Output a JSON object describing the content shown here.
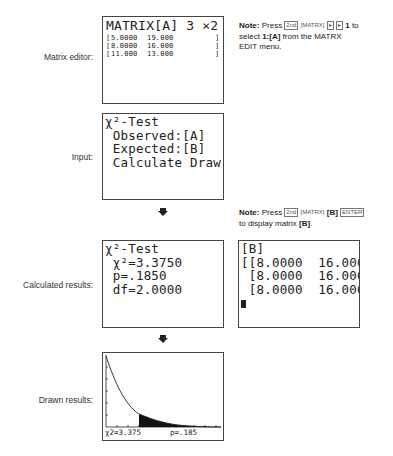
{
  "rows": {
    "matrix_editor": {
      "label": "Matrix editor:"
    },
    "input": {
      "label": "Input:"
    },
    "calculated": {
      "label": "Calculated results:"
    },
    "drawn": {
      "label": "Drawn results:"
    }
  },
  "screens": {
    "matrix_a": {
      "title": "MATRIX[A] 3 ×2",
      "rows": [
        {
          "open": "[",
          "c1": "5.0000",
          "c2": "19.000",
          "close": "]"
        },
        {
          "open": "[",
          "c1": "8.0000",
          "c2": "16.000",
          "close": "]"
        },
        {
          "open": "[",
          "c1": "11.000",
          "c2": "13.000",
          "close": "]"
        }
      ]
    },
    "input": {
      "lines": [
        "χ²-Test",
        " Observed:[A]",
        " Expected:[B]",
        " Calculate Draw"
      ]
    },
    "results": {
      "lines": [
        "χ²-Test",
        " χ²=3.3750",
        " p=.1850",
        " df=2.0000"
      ]
    },
    "matrix_b": {
      "lines": [
        "[B]",
        "[[8.0000  16.000…",
        " [8.0000  16.000…",
        " [8.0000  16.000…"
      ]
    },
    "graph": {
      "chi_label": "χ2=3.375",
      "p_label": "p=.185"
    }
  },
  "notes": {
    "note1": {
      "prefix": "Note:",
      "press": " Press ",
      "key_2nd": "2nd",
      "key_matrx": "[MATRX]",
      "key_right1": "▸",
      "key_right2": "▸",
      "num": "1",
      "to": " to",
      "select": "select ",
      "item": "1:[A]",
      "rest": " from the MATRX",
      "line3": "EDIT menu."
    },
    "note2": {
      "prefix": "Note:",
      "press": " Press ",
      "key_2nd": "2nd",
      "key_matrx": "[MATRX]",
      "key_b": "[B]",
      "key_enter": "ENTER",
      "line2a": "to display matrix ",
      "line2b": "[B]",
      "line2c": "."
    }
  }
}
